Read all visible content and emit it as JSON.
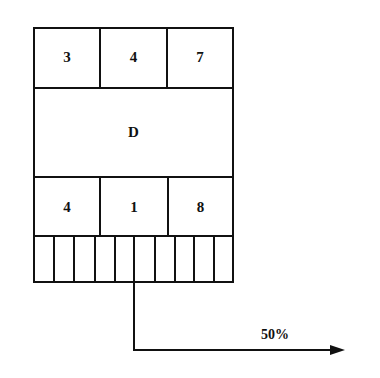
{
  "diagram": {
    "top_row": [
      "3",
      "4",
      "7"
    ],
    "middle_label": "D",
    "bottom_row": [
      "4",
      "1",
      "8"
    ],
    "stripe_count": 10,
    "arrow_label": "50%"
  }
}
